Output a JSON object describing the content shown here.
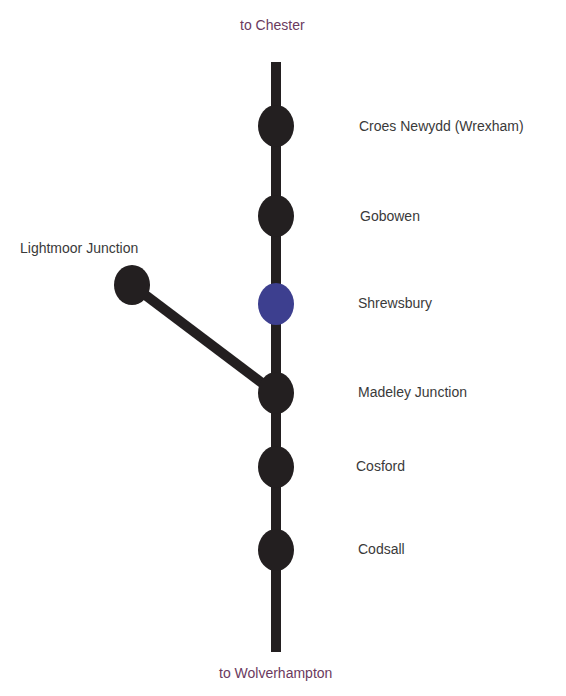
{
  "directions": {
    "north": "to Chester",
    "south": "to Wolverhampton"
  },
  "colors": {
    "track": "#231f20",
    "station": "#231f20",
    "highlight_station": "#3d3f8f",
    "direction_text": "#6b3a5e",
    "label_text": "#3a3a3a"
  },
  "stations": [
    {
      "name": "Croes Newydd (Wrexham)",
      "highlighted": false
    },
    {
      "name": "Gobowen",
      "highlighted": false
    },
    {
      "name": "Shrewsbury",
      "highlighted": true
    },
    {
      "name": "Madeley Junction",
      "highlighted": false
    },
    {
      "name": "Cosford",
      "highlighted": false
    },
    {
      "name": "Codsall",
      "highlighted": false
    }
  ],
  "branch": {
    "name": "Lightmoor Junction",
    "joins_at": "Madeley Junction"
  }
}
